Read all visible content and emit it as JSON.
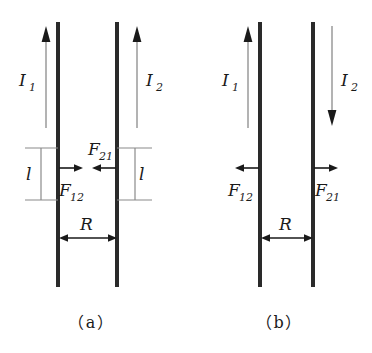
{
  "figure": {
    "type": "physics-diagram",
    "background_color": "#ffffff",
    "wire_color": "#2a2a2a",
    "arrow_color": "#1a1a1a",
    "guide_color": "#8a8a8a"
  },
  "panels": [
    {
      "id": "a",
      "label": "（a）",
      "case": "parallel-currents-attract",
      "currents": [
        {
          "name": "current-1",
          "label": "I",
          "subscript": "1",
          "direction": "up"
        },
        {
          "name": "current-2",
          "label": "I",
          "subscript": "2",
          "direction": "up"
        }
      ],
      "forces": [
        {
          "name": "force-12",
          "label": "F",
          "subscript": "12",
          "direction": "right",
          "on_wire": 1
        },
        {
          "name": "force-21",
          "label": "F",
          "subscript": "21",
          "direction": "left",
          "on_wire": 2
        }
      ],
      "length_markers": [
        {
          "name": "length-left",
          "label": "l"
        },
        {
          "name": "length-right",
          "label": "l"
        }
      ],
      "separation": {
        "name": "separation-R",
        "label": "R"
      }
    },
    {
      "id": "b",
      "label": "（b）",
      "case": "antiparallel-currents-repel",
      "currents": [
        {
          "name": "current-1",
          "label": "I",
          "subscript": "1",
          "direction": "up"
        },
        {
          "name": "current-2",
          "label": "I",
          "subscript": "2",
          "direction": "down"
        }
      ],
      "forces": [
        {
          "name": "force-12",
          "label": "F",
          "subscript": "12",
          "direction": "left",
          "on_wire": 1
        },
        {
          "name": "force-21",
          "label": "F",
          "subscript": "21",
          "direction": "right",
          "on_wire": 2
        }
      ],
      "length_markers": [],
      "separation": {
        "name": "separation-R",
        "label": "R"
      }
    }
  ],
  "text": {
    "a_I1": "I",
    "a_I1_sub": "1",
    "a_I2": "I",
    "a_I2_sub": "2",
    "a_F12": "F",
    "a_F12_sub": "12",
    "a_F21": "F",
    "a_F21_sub": "21",
    "a_l_left": "l",
    "a_l_right": "l",
    "a_R": "R",
    "a_label": "（a）",
    "b_I1": "I",
    "b_I1_sub": "1",
    "b_I2": "I",
    "b_I2_sub": "2",
    "b_F12": "F",
    "b_F12_sub": "12",
    "b_F21": "F",
    "b_F21_sub": "21",
    "b_R": "R",
    "b_label": "（b）"
  }
}
